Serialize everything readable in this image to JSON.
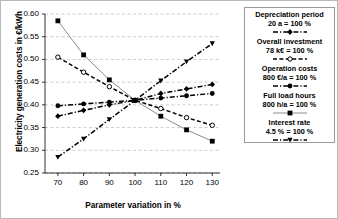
{
  "chart_data": {
    "type": "line",
    "title": "",
    "xlabel": "Parameter variation in %",
    "ylabel": "Electricity generation costs in €/kWh",
    "x": [
      70,
      80,
      90,
      100,
      110,
      120,
      130
    ],
    "xlim": [
      65,
      133
    ],
    "ylim": [
      0.25,
      0.6
    ],
    "xticks": [
      "70",
      "80",
      "90",
      "100",
      "110",
      "120",
      "130"
    ],
    "yticks": [
      "0.25",
      "0.30",
      "0.35",
      "0.40",
      "0.45",
      "0.50",
      "0.55",
      "0.60"
    ],
    "grid": "horizontal-dashed",
    "legend_position": "right-outside",
    "series": [
      {
        "name": "Full load hours",
        "reference": "800 h/a  =  100 %",
        "marker": "filled-square",
        "line_style": "solid",
        "color": "#8c8c8c",
        "values": [
          0.585,
          0.51,
          0.455,
          0.41,
          0.375,
          0.345,
          0.32
        ]
      },
      {
        "name": "Overall investment",
        "reference": "78 k€  =  100 %",
        "marker": "open-circle",
        "line_style": "dashed",
        "color": "#000000",
        "values": [
          0.505,
          0.472,
          0.44,
          0.41,
          0.392,
          0.372,
          0.355
        ]
      },
      {
        "name": "Interest rate",
        "reference": "4.5 % = 100 %",
        "marker": "filled-triangle",
        "line_style": "dash-dot",
        "color": "#000000",
        "values": [
          0.285,
          0.325,
          0.368,
          0.41,
          0.453,
          0.495,
          0.535
        ]
      },
      {
        "name": "Operation costs",
        "reference": "800 €/a = 100 %",
        "marker": "filled-circle",
        "line_style": "dash-dot",
        "color": "#000000",
        "values": [
          0.398,
          0.402,
          0.406,
          0.41,
          0.415,
          0.42,
          0.425
        ]
      },
      {
        "name": "Depreciation period",
        "reference": "20 a  =  100 %",
        "marker": "filled-diamond",
        "line_style": "dash-dot",
        "color": "#000000",
        "values": [
          0.375,
          0.388,
          0.4,
          0.41,
          0.425,
          0.435,
          0.445
        ]
      }
    ]
  },
  "legend": {
    "entries": [
      {
        "title": "Depreciation period",
        "value": "20 a  =  100 %"
      },
      {
        "title": "Overall investment",
        "value": "78 k€  =  100 %"
      },
      {
        "title": "Operation costs",
        "value": "800 €/a = 100 %"
      },
      {
        "title": "Full load hours",
        "value": "800 h/a  =  100 %"
      },
      {
        "title": "Interest rate",
        "value": "4.5 % = 100 %"
      }
    ]
  }
}
